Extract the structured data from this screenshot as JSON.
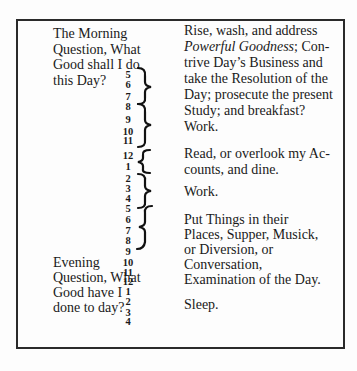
{
  "schedule": {
    "morning_question": [
      "The Morning",
      "Question, What",
      "Good shall I do",
      "this Day?"
    ],
    "evening_question": [
      "Evening",
      "Question, What",
      "Good have I",
      "done to day?"
    ],
    "hours": [
      {
        "label": "5",
        "y": 70
      },
      {
        "label": "6",
        "y": 80
      },
      {
        "label": "7",
        "y": 92
      },
      {
        "label": "8",
        "y": 102
      },
      {
        "label": "9",
        "y": 115
      },
      {
        "label": "10",
        "y": 127
      },
      {
        "label": "11",
        "y": 136
      },
      {
        "label": "12",
        "y": 151
      },
      {
        "label": "1",
        "y": 162
      },
      {
        "label": "2",
        "y": 174
      },
      {
        "label": "3",
        "y": 184
      },
      {
        "label": "4",
        "y": 194
      },
      {
        "label": "5",
        "y": 204
      },
      {
        "label": "6",
        "y": 215
      },
      {
        "label": "7",
        "y": 226
      },
      {
        "label": "8",
        "y": 236
      },
      {
        "label": "9",
        "y": 247
      },
      {
        "label": "10",
        "y": 258
      },
      {
        "label": "11",
        "y": 268
      },
      {
        "label": "12",
        "y": 277
      },
      {
        "label": "1",
        "y": 287
      },
      {
        "label": "2",
        "y": 297
      },
      {
        "label": "3",
        "y": 308
      },
      {
        "label": "4",
        "y": 317
      }
    ],
    "activities": {
      "morning_lines": [
        "Rise, wash, and address",
        "Powerful Goodness; Con-",
        "trive Day’s Business and",
        "take the Resolution of the",
        "Day; prosecute the present",
        "Study; and breakfast?"
      ],
      "work_1": "Work.",
      "read_lines": [
        "Read, or overlook my Ac-",
        "counts, and dine."
      ],
      "work_2": "Work.",
      "evening_lines": [
        "Put Things in their",
        "Places, Supper, Musick,",
        "or Diversion, or",
        "Conversation,",
        "Examination of the Day."
      ],
      "sleep": "Sleep."
    }
  }
}
